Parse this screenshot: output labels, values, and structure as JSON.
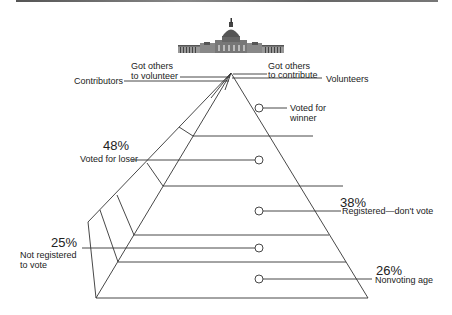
{
  "title_image": "capitol-building-icon",
  "apex_labels": {
    "contributors": "Contributors",
    "got_others_volunteer": [
      "Got others",
      "to volunteer"
    ],
    "got_others_contribute": [
      "Got others",
      "to contribute"
    ],
    "volunteers": "Volunteers"
  },
  "tiers": [
    {
      "label": [
        "Voted for",
        "winner"
      ],
      "percent": ""
    },
    {
      "label": [
        "Voted for loser"
      ],
      "percent": "48%"
    },
    {
      "label": [
        "Registered—don't vote"
      ],
      "percent": "38%"
    },
    {
      "label": [
        "Not registered",
        "to vote"
      ],
      "percent": "25%"
    },
    {
      "label": [
        "Nonvoting age"
      ],
      "percent": "26%"
    }
  ],
  "colors": {
    "line": "#333333",
    "text": "#222222"
  }
}
